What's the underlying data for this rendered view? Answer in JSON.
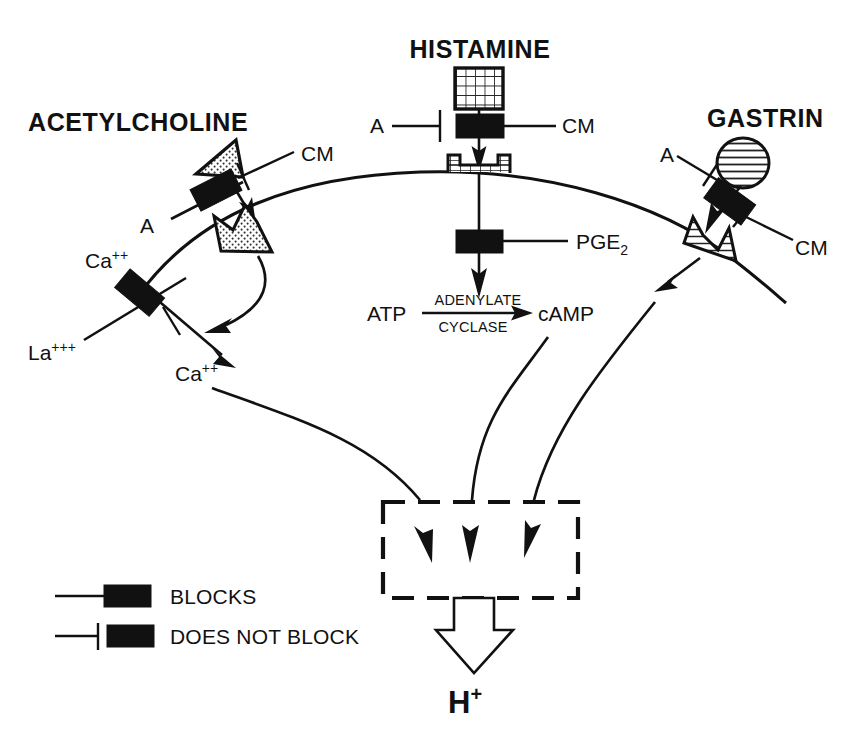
{
  "figure": {
    "kind": "biological-signaling-diagram",
    "background_color": "#ffffff",
    "ink_color": "#111111"
  },
  "titles": {
    "acetylcholine": "ACETYLCHOLINE",
    "histamine": "HISTAMINE",
    "gastrin": "GASTRIN"
  },
  "modulators": {
    "ach_blocker": "A",
    "ach_nonblocker": "CM",
    "hist_blocker": "A",
    "hist_nonblocker": "CM",
    "gastrin_blocker": "A",
    "gastrin_nonblocker": "CM",
    "pge2": "PGE",
    "pge2_subscript": "2"
  },
  "ions": {
    "calcium_influx": "Ca",
    "calcium_influx_charge": "++",
    "lanthanum": "La",
    "lanthanum_charge": "+++",
    "calcium_intracellular": "Ca",
    "calcium_intracellular_charge": "++"
  },
  "enzyme_reaction": {
    "substrate": "ATP",
    "enzyme_line1": "ADENYLATE",
    "enzyme_line2": "CYCLASE",
    "product": "cAMP"
  },
  "output": {
    "proton": "H",
    "proton_charge": "+"
  },
  "legend": {
    "items": [
      {
        "icon": "blocks-symbol",
        "label": "BLOCKS"
      },
      {
        "icon": "does-not-block-symbol",
        "label": "DOES NOT BLOCK"
      }
    ]
  },
  "receptors": {
    "acetylcholine_receptor": "crown-stipple-receptor",
    "histamine_receptor": "grid-cup-receptor",
    "gastrin_receptor": "hatched-saddle-receptor"
  },
  "ligands": {
    "acetylcholine_ligand": "stipple-triangle",
    "histamine_ligand": "grid-square",
    "gastrin_ligand": "striped-ellipse"
  }
}
